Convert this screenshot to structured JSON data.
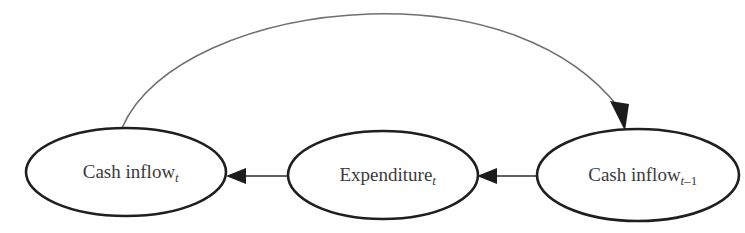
{
  "diagram": {
    "type": "flow-cycle-diagram",
    "background_color": "#ffffff",
    "node_stroke_color": "#1f1f1f",
    "text_color": "#3b3b3b",
    "arrow_color": "#1c1c1c",
    "feedback_arc_color": "#6f6f6f",
    "nodes": [
      {
        "id": "cash-inflow-t",
        "base_label": "Cash inflow",
        "subscript": "t",
        "subscript_style": "italic",
        "cx": 126,
        "cy": 172,
        "rx": 100,
        "ry": 44
      },
      {
        "id": "expenditure-t",
        "base_label": "Expenditure",
        "subscript": "t",
        "subscript_style": "italic",
        "cx": 383,
        "cy": 175,
        "rx": 95,
        "ry": 44
      },
      {
        "id": "cash-inflow-t-minus-1",
        "base_label": "Cash inflow",
        "subscript": "t",
        "subscript_suffix": "–1",
        "subscript_style": "italic",
        "cx": 638,
        "cy": 175,
        "rx": 101,
        "ry": 46
      }
    ],
    "edges": [
      {
        "id": "expenditure-to-cash-inflow-t",
        "from": "expenditure-t",
        "to": "cash-inflow-t",
        "direction": "left",
        "style": "straight"
      },
      {
        "id": "cash-inflow-prev-to-expenditure",
        "from": "cash-inflow-t-minus-1",
        "to": "expenditure-t",
        "direction": "left",
        "style": "straight"
      },
      {
        "id": "cash-inflow-t-to-cash-inflow-prev",
        "from": "cash-inflow-t",
        "to": "cash-inflow-t-minus-1",
        "direction": "right-down",
        "style": "curved-arc"
      }
    ]
  }
}
